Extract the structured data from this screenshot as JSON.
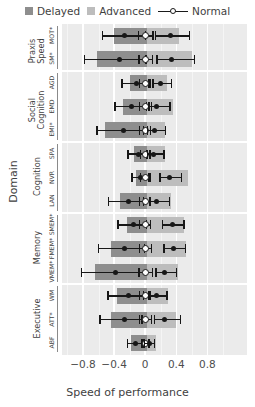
{
  "legend": {
    "items": [
      {
        "label": "Delayed",
        "type": "square",
        "color": "#8e8e8e"
      },
      {
        "label": "Advanced",
        "type": "square",
        "color": "#bdbdbd"
      },
      {
        "label": "Normal",
        "type": "line-marker",
        "color": "#171717"
      }
    ]
  },
  "axes": {
    "ylabel": "Domain",
    "xlabel": "Speed of performance",
    "xticks": [
      "−0.8",
      "−0.4",
      "0",
      "0.4",
      "0.8"
    ],
    "xtickvals": [
      -0.8,
      -0.4,
      0,
      0.4,
      0.8
    ],
    "xlim": [
      -1.07,
      1.31
    ]
  },
  "chart_data": {
    "type": "bar",
    "title": "",
    "xlabel": "Speed of performance",
    "ylabel": "Domain",
    "xlim": [
      -1.07,
      1.31
    ],
    "grid": true,
    "legend_position": "top",
    "legend": [
      "Delayed",
      "Advanced",
      "Normal"
    ],
    "groups": [
      {
        "name": "Praxis\nSpeed",
        "tests": [
          {
            "label": "MOT*",
            "delayed_bar": [
              -0.4,
              0.02
            ],
            "advanced_bar": [
              0.02,
              0.44
            ],
            "delayed": {
              "est": -0.27,
              "lo": -0.55,
              "hi": 0.0
            },
            "normal": {
              "est": 0.0,
              "lo": -0.09,
              "hi": 0.1
            },
            "advanced": {
              "est": 0.33,
              "lo": 0.13,
              "hi": 0.57
            }
          },
          {
            "label": "SM*",
            "delayed_bar": [
              -0.62,
              0.02
            ],
            "advanced_bar": [
              0.02,
              0.6
            ],
            "delayed": {
              "est": -0.33,
              "lo": -0.78,
              "hi": 0.01
            },
            "normal": {
              "est": 0.0,
              "lo": -0.08,
              "hi": 0.09
            },
            "advanced": {
              "est": 0.34,
              "lo": 0.15,
              "hi": 0.63
            }
          }
        ]
      },
      {
        "name": "Social\nCognition",
        "tests": [
          {
            "label": "AGD",
            "delayed_bar": [
              -0.2,
              0.02
            ],
            "advanced_bar": [
              0.02,
              0.28
            ],
            "delayed": {
              "est": -0.11,
              "lo": -0.3,
              "hi": 0.05
            },
            "normal": {
              "est": 0.0,
              "lo": -0.07,
              "hi": 0.07
            },
            "advanced": {
              "est": 0.2,
              "lo": 0.1,
              "hi": 0.34
            }
          },
          {
            "label": "EMD",
            "delayed_bar": [
              -0.28,
              0.02
            ],
            "advanced_bar": [
              0.02,
              0.36
            ],
            "delayed": {
              "est": -0.17,
              "lo": -0.39,
              "hi": 0.02
            },
            "normal": {
              "est": 0.0,
              "lo": -0.07,
              "hi": 0.08
            },
            "advanced": {
              "est": 0.15,
              "lo": 0.05,
              "hi": 0.32
            }
          },
          {
            "label": "EMI*",
            "delayed_bar": [
              -0.52,
              0.02
            ],
            "advanced_bar": [
              0.02,
              0.25
            ],
            "delayed": {
              "est": -0.28,
              "lo": -0.62,
              "hi": -0.02
            },
            "normal": {
              "est": 0.0,
              "lo": -0.07,
              "hi": 0.07
            },
            "advanced": {
              "est": 0.12,
              "lo": 0.03,
              "hi": 0.26
            }
          }
        ]
      },
      {
        "name": "Cognition",
        "tests": [
          {
            "label": "SPA",
            "delayed_bar": [
              -0.14,
              0.02
            ],
            "advanced_bar": [
              0.02,
              0.26
            ],
            "delayed": {
              "est": -0.09,
              "lo": -0.22,
              "hi": 0.02
            },
            "normal": {
              "est": 0.0,
              "lo": -0.06,
              "hi": 0.06
            },
            "advanced": {
              "est": 0.11,
              "lo": 0.03,
              "hi": 0.24
            }
          },
          {
            "label": "NVR",
            "delayed_bar": [
              -0.12,
              0.02
            ],
            "advanced_bar": [
              0.02,
              0.55
            ],
            "delayed": {
              "est": -0.06,
              "lo": -0.17,
              "hi": 0.04
            },
            "normal": {
              "est": 0.0,
              "lo": -0.06,
              "hi": 0.06
            },
            "advanced": {
              "est": 0.31,
              "lo": 0.19,
              "hi": 0.47
            }
          },
          {
            "label": "LAN",
            "delayed_bar": [
              -0.33,
              0.02
            ],
            "advanced_bar": [
              0.02,
              0.33
            ],
            "delayed": {
              "est": -0.22,
              "lo": -0.47,
              "hi": -0.02
            },
            "normal": {
              "est": 0.0,
              "lo": -0.07,
              "hi": 0.07
            },
            "advanced": {
              "est": 0.15,
              "lo": 0.06,
              "hi": 0.31
            }
          }
        ]
      },
      {
        "name": "Memory",
        "tests": [
          {
            "label": "SMEM*",
            "delayed_bar": [
              -0.24,
              0.02
            ],
            "advanced_bar": [
              0.02,
              0.5
            ],
            "delayed": {
              "est": -0.15,
              "lo": -0.35,
              "hi": 0.02
            },
            "normal": {
              "est": 0.0,
              "lo": -0.07,
              "hi": 0.07
            },
            "advanced": {
              "est": 0.35,
              "lo": 0.22,
              "hi": 0.5
            }
          },
          {
            "label": "FMEM*",
            "delayed_bar": [
              -0.44,
              0.02
            ],
            "advanced_bar": [
              0.02,
              0.52
            ],
            "delayed": {
              "est": -0.27,
              "lo": -0.6,
              "hi": -0.01
            },
            "normal": {
              "est": 0.0,
              "lo": -0.07,
              "hi": 0.08
            },
            "advanced": {
              "est": 0.37,
              "lo": 0.24,
              "hi": 0.52
            }
          },
          {
            "label": "VMEM*",
            "delayed_bar": [
              -0.64,
              0.02
            ],
            "advanced_bar": [
              0.02,
              0.42
            ],
            "delayed": {
              "est": -0.38,
              "lo": -0.82,
              "hi": -0.09
            },
            "normal": {
              "est": 0.0,
              "lo": -0.08,
              "hi": 0.09
            },
            "advanced": {
              "est": 0.25,
              "lo": 0.14,
              "hi": 0.4
            }
          }
        ]
      },
      {
        "name": "Executive",
        "tests": [
          {
            "label": "WM",
            "delayed_bar": [
              -0.36,
              0.02
            ],
            "advanced_bar": [
              0.02,
              0.3
            ],
            "delayed": {
              "est": -0.22,
              "lo": -0.48,
              "hi": -0.02
            },
            "normal": {
              "est": 0.0,
              "lo": -0.07,
              "hi": 0.07
            },
            "advanced": {
              "est": 0.14,
              "lo": 0.05,
              "hi": 0.28
            }
          },
          {
            "label": "ATT*",
            "delayed_bar": [
              -0.44,
              0.02
            ],
            "advanced_bar": [
              0.02,
              0.4
            ],
            "delayed": {
              "est": -0.26,
              "lo": -0.58,
              "hi": -0.04
            },
            "normal": {
              "est": 0.0,
              "lo": -0.07,
              "hi": 0.08
            },
            "advanced": {
              "est": 0.25,
              "lo": 0.12,
              "hi": 0.45
            }
          },
          {
            "label": "ABF",
            "delayed_bar": [
              -0.18,
              0.02
            ],
            "advanced_bar": [
              0.02,
              0.14
            ],
            "delayed": {
              "est": -0.12,
              "lo": -0.23,
              "hi": -0.03
            },
            "normal": {
              "est": 0.0,
              "lo": -0.05,
              "hi": 0.05
            },
            "advanced": {
              "est": 0.05,
              "lo": -0.01,
              "hi": 0.12
            }
          }
        ]
      }
    ]
  }
}
